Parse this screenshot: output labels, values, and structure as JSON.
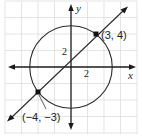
{
  "diagram": {
    "type": "coordinate-plane",
    "axes": {
      "x_label": "x",
      "y_label": "y"
    },
    "tick_labels": {
      "x_tick": "2",
      "y_tick": "2"
    },
    "grid": {
      "units_per_cell": 2
    },
    "circle": {
      "center": [
        0,
        0
      ],
      "radius": 5
    },
    "line": {
      "slope": 1,
      "intercept": 1
    },
    "points": [
      {
        "coords": [
          3,
          4
        ],
        "label": "(3, 4)"
      },
      {
        "coords": [
          -4,
          -3
        ],
        "label": "(−4, −3)"
      }
    ]
  },
  "colors": {
    "grid": "#d9d9d9",
    "ink": "#1a1a1a",
    "background": "#ffffff"
  }
}
